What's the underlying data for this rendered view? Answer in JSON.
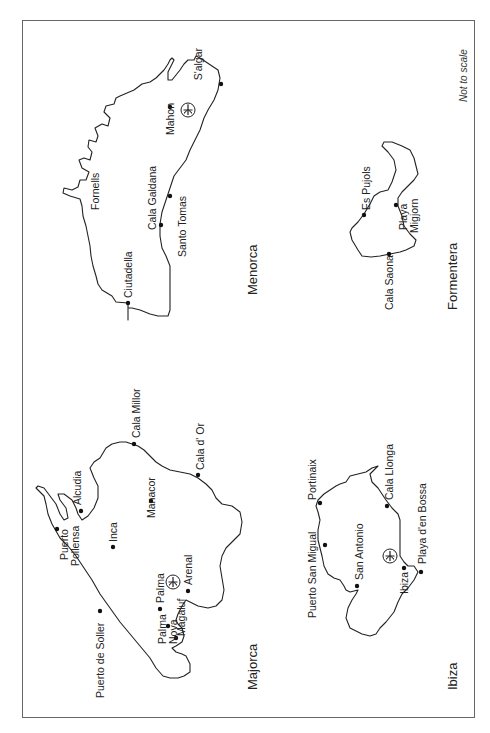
{
  "map": {
    "orientation": "rotated 90 degrees counter-clockwise",
    "note": "Not to scale",
    "islands": [
      {
        "name": "Menorca",
        "towns": [
          "S'algar",
          "Mahon",
          "Cala Galdana",
          "Santo Tomas",
          "Fornells",
          "Ciutadella"
        ],
        "airport": true
      },
      {
        "name": "Formentera",
        "towns": [
          "Es Pujols",
          "Playa Migjorn",
          "Cala Saona"
        ],
        "airport": false
      },
      {
        "name": "Majorca",
        "towns": [
          "Cala Millor",
          "Cala d' Or",
          "Alcudia",
          "Manacor",
          "Puerto Pollensa",
          "Inca",
          "Arenal",
          "Palma",
          "Magaluf",
          "Palma Nova",
          "Puerto de Soller"
        ],
        "airport": true
      },
      {
        "name": "Ibiza",
        "towns": [
          "Portinaix",
          "Cala Llonga",
          "Puerto San Migual",
          "San Antonio",
          "Playa d'en Bossa",
          "Ibiza"
        ],
        "airport": true
      }
    ]
  },
  "labels": {
    "note": "Not to scale",
    "menorca": "Menorca",
    "formentera": "Formentera",
    "majorca": "Majorca",
    "ibiza": "Ibiza",
    "salgar": "S'algar",
    "mahon": "Mahon",
    "cala_galdana": "Cala Galdana",
    "santo_tomas": "Santo Tomas",
    "fornells": "Fornells",
    "ciutadella": "Ciutadella",
    "es_pujols": "Es Pujols",
    "playa": "Playa",
    "migjorn": "Migjorn",
    "cala_saona": "Cala Saona",
    "cala_millor": "Cala Millor",
    "cala_dor": "Cala d' Or",
    "alcudia": "Alcudia",
    "manacor": "Manacor",
    "puerto": "Puerto",
    "pollensa": "Pollensa",
    "inca": "Inca",
    "arenal": "Arenal",
    "palma": "Palma",
    "magaluf": "Magaluf",
    "palma_nova_1": "Palma",
    "palma_nova_2": "Nova",
    "puerto_de_soller": "Puerto de Soller",
    "portinaix": "Portinaix",
    "cala_llonga": "Cala Llonga",
    "puerto_san_migual": "Puerto San Migual",
    "san_antonio": "San Antonio",
    "playa_den_bossa": "Playa d'en Bossa",
    "ibiza_town": "Ibiza"
  }
}
